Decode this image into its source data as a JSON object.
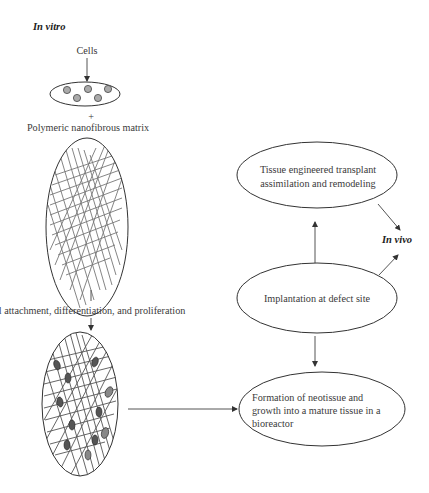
{
  "labels": {
    "in_vitro": "In vitro",
    "in_vivo": "In vivo",
    "cells": "Cells",
    "plus": "+",
    "matrix": "Polymeric nanofibrous matrix",
    "attachment": "Cell attachment, differentiation, and proliferation"
  },
  "nodes": {
    "transplant": {
      "line1": "Tissue engineered transplant",
      "line2": "assimilation and remodeling"
    },
    "implantation": {
      "line1": "Implantation at defect site"
    },
    "formation": {
      "line1": "Formation of neotissue and",
      "line2": "growth into a mature tissue in a",
      "line3": "bioreactor"
    }
  },
  "edges": [
    {
      "from": "cells",
      "to": "cell-suspension"
    },
    {
      "from": "seeded-scaffold",
      "to": "formation"
    },
    {
      "from": "implantation",
      "to": "transplant"
    },
    {
      "from": "implantation",
      "to": "formation"
    },
    {
      "from": "transplant",
      "to": "in-vivo"
    },
    {
      "from": "implantation",
      "to": "in-vivo"
    }
  ],
  "colors": {
    "line": "#555555",
    "text": "#333333",
    "fiber": "#777777",
    "cell_fill": "#aaaaaa"
  }
}
